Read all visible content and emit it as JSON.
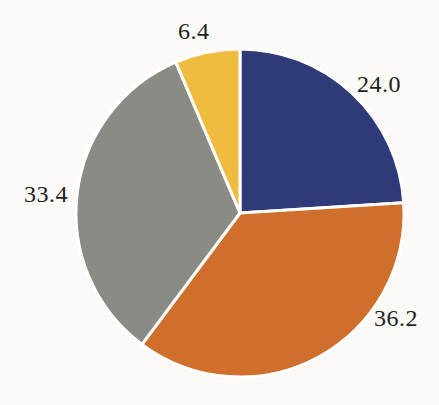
{
  "chart_data": {
    "type": "pie",
    "series_names": [
      "blue",
      "orange",
      "gray",
      "yellow"
    ],
    "values": [
      24.0,
      36.2,
      33.4,
      6.4
    ],
    "labels": [
      "24.0",
      "36.2",
      "33.4",
      "6.4"
    ],
    "slice_colors": [
      "#2f3b78",
      "#d06e2c",
      "#8b8b85",
      "#f0bc3f"
    ],
    "start_angle_deg": 0,
    "direction": "clockwise",
    "gap_color": "#ffffff",
    "background_color": "#fbfaf6",
    "label_color": "#1f1f1f",
    "title": "",
    "legend": "none",
    "labels_position": "outside"
  }
}
